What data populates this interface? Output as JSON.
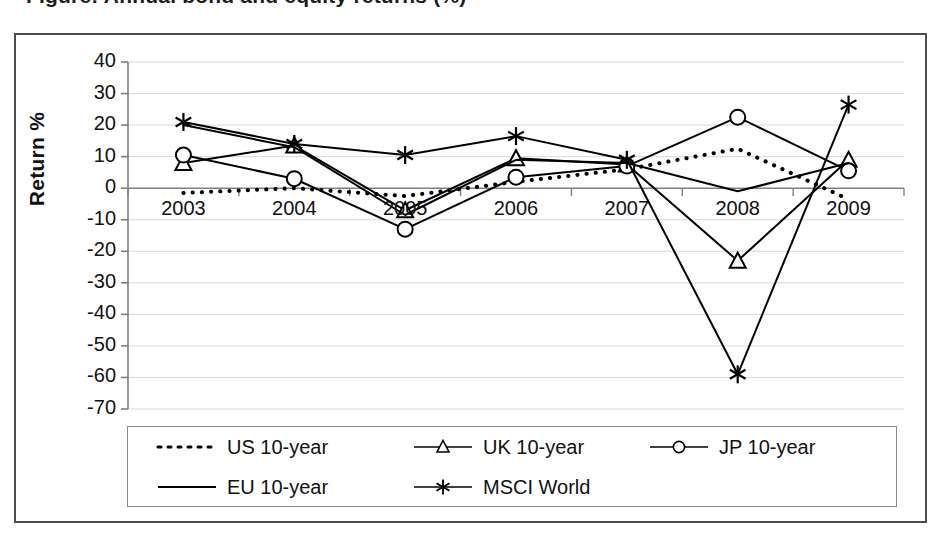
{
  "figure": {
    "cropped_title": "Figure: Annual bond and equity returns (%)"
  },
  "chart_data": {
    "type": "line",
    "title": "",
    "xlabel": "",
    "ylabel": "Return %",
    "categories": [
      "2003",
      "2004",
      "2005",
      "2006",
      "2007",
      "2008",
      "2009"
    ],
    "x_tick_labels": [
      "2003",
      "2004",
      "2005",
      "2006",
      "2007",
      "2008",
      "2009"
    ],
    "y_tick_labels": [
      "40",
      "30",
      "20",
      "10",
      "0",
      "-10",
      "-20",
      "-30",
      "-40",
      "-50",
      "-60",
      "-70"
    ],
    "ylim": [
      -70,
      40
    ],
    "y_tick_step": 10,
    "grid": true,
    "legend_position": "bottom",
    "series": [
      {
        "name": "US 10-year",
        "style": "dotted",
        "marker": "none",
        "color": "#000000",
        "values": [
          -1.5,
          0.0,
          -2.5,
          2.0,
          6.0,
          12.5,
          -3.5
        ]
      },
      {
        "name": "UK 10-year",
        "style": "solid",
        "marker": "triangle",
        "color": "#000000",
        "values": [
          8.0,
          13.5,
          -7.0,
          9.5,
          7.5,
          -23.0,
          9.0
        ]
      },
      {
        "name": "JP 10-year",
        "style": "solid",
        "marker": "circle",
        "color": "#000000",
        "values": [
          10.5,
          3.0,
          -13.0,
          3.5,
          7.0,
          22.5,
          5.5
        ]
      },
      {
        "name": "EU 10-year",
        "style": "solid",
        "marker": "none",
        "color": "#000000",
        "values": [
          20.0,
          13.0,
          -8.5,
          9.0,
          8.0,
          -1.0,
          8.0
        ]
      },
      {
        "name": "MSCI World",
        "style": "solid",
        "marker": "asterisk",
        "color": "#000000",
        "values": [
          21.0,
          14.0,
          10.5,
          16.5,
          9.0,
          -59.0,
          26.5
        ]
      }
    ]
  },
  "legend": {
    "entries": [
      {
        "label": "US 10-year",
        "swatch": "dotted-line-swatch"
      },
      {
        "label": "UK 10-year",
        "swatch": "line-triangle-swatch"
      },
      {
        "label": "JP 10-year",
        "swatch": "line-circle-swatch"
      },
      {
        "label": "EU 10-year",
        "swatch": "solid-line-swatch"
      },
      {
        "label": "MSCI World",
        "swatch": "line-asterisk-swatch"
      }
    ]
  },
  "colors": {
    "ink": "#000000",
    "frame": "#4d4d4d",
    "grid": "#d9d9d9",
    "axis": "#808080"
  }
}
